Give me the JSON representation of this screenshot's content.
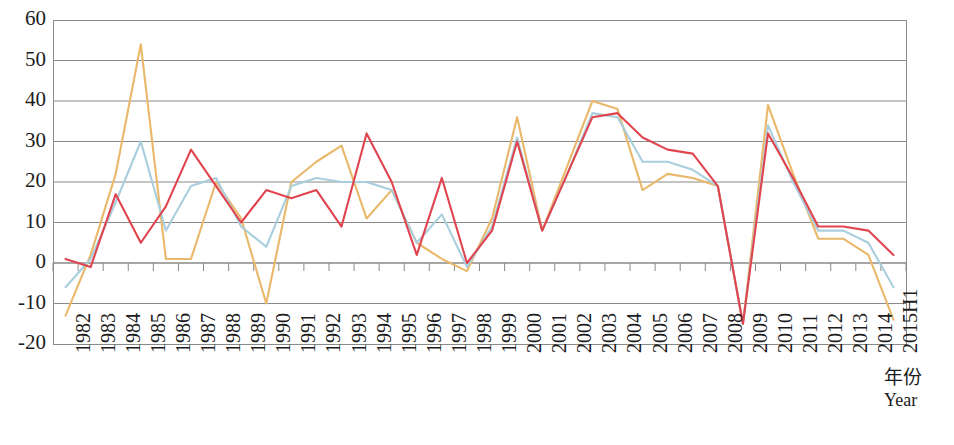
{
  "chart_data": {
    "type": "line",
    "title": "",
    "subtitle": "",
    "xlabel_cn": "年份",
    "xlabel_en": "Year",
    "ylabel": "",
    "xlim_note": "categorical",
    "ylim": [
      -20,
      60
    ],
    "ytick_step": 10,
    "grid": true,
    "grid_axis": "y",
    "legend_position": "none",
    "categories": [
      "1982",
      "1983",
      "1984",
      "1985",
      "1986",
      "1987",
      "1988",
      "1989",
      "1990",
      "1991",
      "1992",
      "1993",
      "1994",
      "1995",
      "1996",
      "1997",
      "1998",
      "1999",
      "2000",
      "2001",
      "2002",
      "2003",
      "2004",
      "2005",
      "2006",
      "2007",
      "2008",
      "2009",
      "2010",
      "2011",
      "2012",
      "2013",
      "2014",
      "2015H1"
    ],
    "yticks": [
      60,
      50,
      40,
      30,
      20,
      10,
      0,
      -10,
      -20
    ],
    "ytick_labels": [
      "60",
      "50",
      "40",
      "30",
      "20",
      "10",
      "0",
      "-10",
      "-20"
    ],
    "series": [
      {
        "name": "series-orange",
        "color": "#E9B86A",
        "values": [
          -13,
          2,
          22,
          54,
          1,
          1,
          20,
          11,
          -10,
          20,
          25,
          29,
          11,
          18,
          5,
          1,
          -2,
          11,
          36,
          8,
          24,
          40,
          38,
          18,
          22,
          21,
          19,
          -15,
          39,
          22,
          6,
          6,
          2,
          -14
        ]
      },
      {
        "name": "series-blue",
        "color": "#A9CEDD",
        "values": [
          -6,
          1,
          15,
          30,
          8,
          19,
          21,
          9,
          4,
          19,
          21,
          20,
          20,
          18,
          5,
          12,
          -1,
          9,
          31,
          8,
          22,
          37,
          36,
          25,
          25,
          23,
          19,
          -15,
          34,
          20,
          8,
          8,
          5,
          -6
        ]
      },
      {
        "name": "series-red",
        "color": "#E0444F",
        "values": [
          1,
          -1,
          17,
          5,
          14,
          28,
          19,
          10,
          18,
          16,
          18,
          9,
          32,
          20,
          2,
          21,
          0,
          8,
          30,
          8,
          22,
          36,
          37,
          31,
          28,
          27,
          19,
          -15,
          32,
          21,
          9,
          9,
          8,
          2
        ]
      }
    ]
  },
  "axes": {
    "plot_left": 53,
    "plot_top": 20,
    "plot_right": 906,
    "plot_bottom": 344
  },
  "colors": {
    "grid": "#8a8a8a",
    "frame": "#8a8a8a",
    "text": "#1c1c1c",
    "background": "#ffffff"
  }
}
